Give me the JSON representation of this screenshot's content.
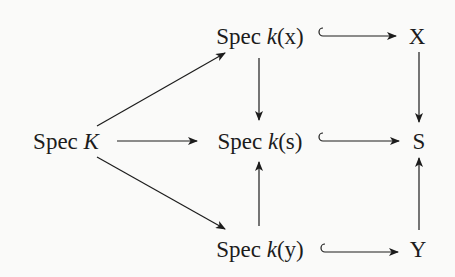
{
  "diagram": {
    "type": "commutative-diagram",
    "nodes": {
      "spec_kx": {
        "op": "Spec",
        "arg": "k(x)",
        "var": "k",
        "paren": "(x)"
      },
      "X": {
        "label": "X"
      },
      "spec_K": {
        "op": "Spec",
        "var": "K"
      },
      "spec_ks": {
        "op": "Spec",
        "var": "k",
        "paren": "(s)"
      },
      "S": {
        "label": "S"
      },
      "spec_ky": {
        "op": "Spec",
        "var": "k",
        "paren": "(y)"
      },
      "Y": {
        "label": "Y"
      }
    },
    "edges": [
      {
        "from": "Spec K",
        "to": "Spec k(x)",
        "style": "arrow"
      },
      {
        "from": "Spec K",
        "to": "Spec k(s)",
        "style": "arrow"
      },
      {
        "from": "Spec K",
        "to": "Spec k(y)",
        "style": "arrow"
      },
      {
        "from": "Spec k(x)",
        "to": "X",
        "style": "hook-arrow"
      },
      {
        "from": "Spec k(s)",
        "to": "S",
        "style": "hook-arrow"
      },
      {
        "from": "Spec k(y)",
        "to": "Y",
        "style": "hook-arrow"
      },
      {
        "from": "Spec k(x)",
        "to": "Spec k(s)",
        "style": "arrow"
      },
      {
        "from": "Spec k(y)",
        "to": "Spec k(s)",
        "style": "arrow"
      },
      {
        "from": "X",
        "to": "S",
        "style": "arrow"
      },
      {
        "from": "Y",
        "to": "S",
        "style": "arrow"
      }
    ],
    "colors": {
      "ink": "#1c1c1c",
      "background": "#fafaf9"
    }
  }
}
